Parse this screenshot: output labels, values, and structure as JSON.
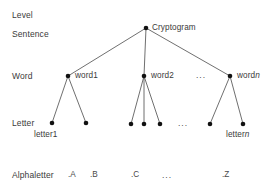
{
  "diagram": {
    "title": "Level",
    "background_color": "#ffffff",
    "line_color": "#4a4a4a",
    "node_color": "#111111",
    "text_color": "#3a3a3a",
    "level_labels": [
      {
        "id": "level-header",
        "text": "Level",
        "x": 12,
        "y": 11
      },
      {
        "id": "level-sentence",
        "text": "Sentence",
        "x": 12,
        "y": 30
      },
      {
        "id": "level-word",
        "text": "Word",
        "x": 12,
        "y": 72
      },
      {
        "id": "level-letter",
        "text": "Letter",
        "x": 12,
        "y": 120
      },
      {
        "id": "level-alphaletter",
        "text": "Alphaletter",
        "x": 12,
        "y": 172
      }
    ],
    "nodes": [
      {
        "id": "root",
        "label": "Cryptogram",
        "x": 146,
        "y": 28,
        "label_x": 152,
        "label_y": 24
      },
      {
        "id": "word1",
        "label": "word1",
        "x": 68,
        "y": 76,
        "label_x": 75,
        "label_y": 72
      },
      {
        "id": "word2",
        "label": "word2",
        "x": 144,
        "y": 76,
        "label_x": 151,
        "label_y": 72
      },
      {
        "id": "wordn",
        "label": "word",
        "label_suffix": "n",
        "x": 230,
        "y": 76,
        "label_x": 237,
        "label_y": 72
      },
      {
        "id": "letter1",
        "label": "letter1",
        "x": 52,
        "y": 123,
        "label_x": 34,
        "label_y": 131
      },
      {
        "id": "letter1b",
        "label": "",
        "x": 86,
        "y": 123,
        "label_x": 0,
        "label_y": 0
      },
      {
        "id": "letter2a",
        "label": "",
        "x": 131,
        "y": 124,
        "label_x": 0,
        "label_y": 0
      },
      {
        "id": "letter2b",
        "label": "",
        "x": 144,
        "y": 124,
        "label_x": 0,
        "label_y": 0
      },
      {
        "id": "letter2c",
        "label": "",
        "x": 160,
        "y": 124,
        "label_x": 0,
        "label_y": 0
      },
      {
        "id": "letterna",
        "label": "",
        "x": 210,
        "y": 124,
        "label_x": 0,
        "label_y": 0
      },
      {
        "id": "lettern",
        "label": "letter",
        "label_suffix": "n",
        "x": 243,
        "y": 124,
        "label_x": 226,
        "label_y": 131
      }
    ],
    "edges": [
      {
        "from": "root",
        "to": "word1"
      },
      {
        "from": "root",
        "to": "word2"
      },
      {
        "from": "root",
        "to": "wordn"
      },
      {
        "from": "word1",
        "to": "letter1"
      },
      {
        "from": "word1",
        "to": "letter1b"
      },
      {
        "from": "word2",
        "to": "letter2a"
      },
      {
        "from": "word2",
        "to": "letter2b"
      },
      {
        "from": "word2",
        "to": "letter2c"
      },
      {
        "from": "wordn",
        "to": "letterna"
      },
      {
        "from": "wordn",
        "to": "lettern"
      }
    ],
    "ellipses": [
      {
        "id": "ellipsis-word-row",
        "text": "...",
        "x": 196,
        "y": 72
      },
      {
        "id": "ellipsis-letter-row",
        "text": "...",
        "x": 178,
        "y": 120
      },
      {
        "id": "ellipsis-alpha-row",
        "text": "...",
        "x": 162,
        "y": 172
      }
    ],
    "alphaletters": [
      {
        "id": "alpha-a",
        "text": ".A",
        "x": 68,
        "y": 172
      },
      {
        "id": "alpha-b",
        "text": ".B",
        "x": 90,
        "y": 172
      },
      {
        "id": "alpha-c",
        "text": ".C",
        "x": 131,
        "y": 172
      },
      {
        "id": "alpha-z",
        "text": ".Z",
        "x": 222,
        "y": 172
      }
    ]
  }
}
